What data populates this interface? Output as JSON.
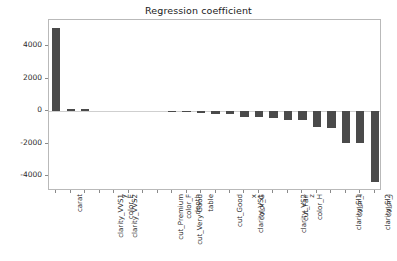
{
  "chart_data": {
    "type": "bar",
    "title": "Regression coefficient",
    "xlabel": "",
    "ylabel": "",
    "grid": false,
    "legend": null,
    "ylim": [
      -4900,
      5600
    ],
    "yticks": [
      4000,
      2000,
      0,
      -2000,
      -4000
    ],
    "ytick_labels": [
      "4000",
      "2000",
      "0",
      "-2000",
      "-4000"
    ],
    "bar_color": "#4a4a4a",
    "orientation": "vertical",
    "categories": [
      "carat",
      "clarity_VVS1",
      "clarity_VVS2",
      "color_E",
      "y",
      "cut_Premium",
      "cut_Very Good",
      "color_F",
      "depth",
      "table",
      "cut_Good",
      "clarity_VS1",
      "color_G",
      "x",
      "clarity_VS2",
      "cut_Fair",
      "color_H",
      "z",
      "clarity_SI1",
      "color_I",
      "clarity_SI2",
      "color_J",
      "clarity_I1"
    ],
    "values": [
      5130,
      110,
      105,
      0,
      0,
      0,
      0,
      0,
      -20,
      -60,
      -110,
      -150,
      -170,
      -330,
      -350,
      -390,
      -520,
      -560,
      -970,
      -1020,
      -1980,
      -1980,
      -4350
    ]
  }
}
